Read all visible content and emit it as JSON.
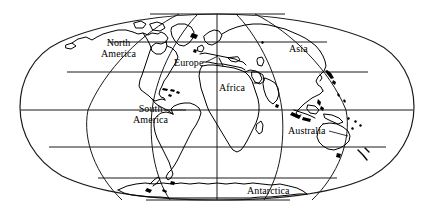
{
  "map": {
    "title": "World Map",
    "projection": "oval equal-area world map (Mollweide-like)",
    "background_color": "#ffffff",
    "line_color": "#000000",
    "label_color": "#000000",
    "labels": [
      {
        "id": "north-america",
        "text_line1": "North",
        "text_line2": "America",
        "x": 104,
        "y": 38,
        "has_leader": false
      },
      {
        "id": "europe",
        "text_line1": "Europe",
        "text_line2": "",
        "x": 174,
        "y": 57,
        "has_leader": true
      },
      {
        "id": "asia",
        "text_line1": "Asia",
        "text_line2": "",
        "x": 288,
        "y": 43,
        "has_leader": false
      },
      {
        "id": "africa",
        "text_line1": "Africa",
        "text_line2": "",
        "x": 218,
        "y": 82,
        "has_leader": false
      },
      {
        "id": "south-america",
        "text_line1": "South",
        "text_line2": "America",
        "x": 136,
        "y": 104,
        "has_leader": true
      },
      {
        "id": "australia",
        "text_line1": "Australia",
        "text_line2": "",
        "x": 288,
        "y": 125,
        "has_leader": true
      },
      {
        "id": "antarctica",
        "text_line1": "Antarctica",
        "text_line2": "",
        "x": 247,
        "y": 185,
        "has_leader": false
      }
    ],
    "graticule": {
      "meridian_interval_degrees": 60,
      "parallel_interval_degrees": 30,
      "central_meridian_x": 217,
      "equator_y": 110,
      "meridian_x_at_equator": [
        24,
        88,
        152,
        217,
        282,
        346,
        412
      ],
      "parallel_y": [
        14,
        42,
        72,
        110,
        147,
        178,
        200
      ],
      "parallel_labels_degrees": [
        90,
        60,
        30,
        0,
        -30,
        -60,
        -90
      ]
    }
  }
}
